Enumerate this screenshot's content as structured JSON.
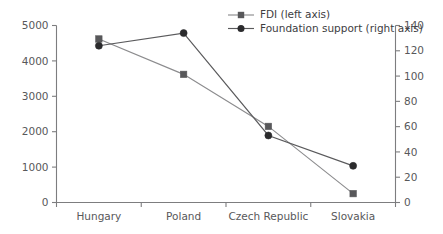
{
  "chart_data": {
    "type": "line",
    "title": "",
    "subtitle": "",
    "xlabel": "",
    "categories": [
      "Hungary",
      "Poland",
      "Czech Republic",
      "Slovakia"
    ],
    "grid": false,
    "legend_position": "top-right",
    "series": [
      {
        "name": "FDI (left axis)",
        "axis": "left",
        "marker": "square",
        "color": "#58585a",
        "line_color": "#8c8c8e",
        "values": [
          4620,
          3620,
          2150,
          250
        ]
      },
      {
        "name": "Foundation support (right axis)",
        "axis": "right",
        "marker": "circle",
        "color": "#2b2b2d",
        "line_color": "#5a5a5c",
        "values": [
          124,
          134,
          53,
          29
        ]
      }
    ],
    "left_axis": {
      "label": "",
      "ylim": [
        0,
        5000
      ],
      "ticks": [
        0,
        1000,
        2000,
        3000,
        4000,
        5000
      ],
      "tick_labels": [
        "0",
        "1000",
        "2000",
        "3000",
        "4000",
        "5000"
      ]
    },
    "right_axis": {
      "label": "",
      "ylim": [
        0,
        140
      ],
      "ticks": [
        0,
        20,
        40,
        60,
        80,
        100,
        120,
        140
      ],
      "tick_labels": [
        "0",
        "20",
        "40",
        "60",
        "80",
        "100",
        "120",
        "140"
      ]
    },
    "legend": [
      {
        "label": "FDI (left axis)",
        "marker": "square"
      },
      {
        "label": "Foundation support (right axis)",
        "marker": "circle"
      }
    ]
  },
  "colors": {
    "axis": "#7d7d7f",
    "text": "#58585a",
    "series_fdi": "#58585a",
    "series_foundation": "#2b2b2d",
    "background": "#ffffff"
  }
}
